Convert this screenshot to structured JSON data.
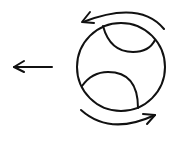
{
  "diagram": {
    "stroke_color": "#111111",
    "background": "#ffffff",
    "elements": [
      {
        "name": "motion-arrow",
        "direction": "left"
      },
      {
        "name": "ball",
        "seams": 2
      },
      {
        "name": "rotation-arrow-top",
        "direction": "counterclockwise"
      },
      {
        "name": "rotation-arrow-bottom",
        "direction": "counterclockwise"
      }
    ]
  }
}
